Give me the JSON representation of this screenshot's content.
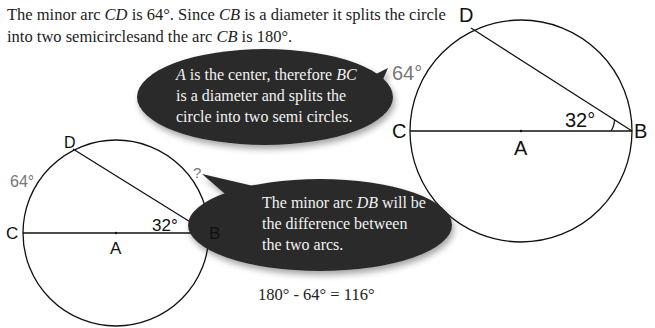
{
  "intro": {
    "line1_parts": [
      "The minor arc ",
      "CD",
      " is 64°.  Since ",
      "CB",
      " is a diameter it splits the circle"
    ],
    "line2_parts": [
      "into two semicirclesand the arc ",
      "CB",
      " is 180°."
    ]
  },
  "bubble_top": {
    "line1_parts": [
      "A",
      " is the center, therefore ",
      "BC"
    ],
    "line2": "is a diameter and splits the",
    "line3": "circle into two semi circles."
  },
  "bubble_bottom": {
    "line1_parts": [
      "The minor arc ",
      "DB",
      " will be"
    ],
    "line2": "the difference between",
    "line3": "the two arcs."
  },
  "formula": "180° - 64° = 116°",
  "diagram_large": {
    "points": {
      "C": "C",
      "A": "A",
      "B": "B",
      "D": "D"
    },
    "arc_label": "64°",
    "angle_label": "32°"
  },
  "diagram_small": {
    "points": {
      "C": "C",
      "A": "A",
      "B": "B",
      "D": "D"
    },
    "arc_label": "64°",
    "angle_label": "32°",
    "unknown_arc_label": "?"
  },
  "colors": {
    "bubble": "#2b2b2b",
    "bubble_text": "#f2f2f2",
    "arc_label": "#777777",
    "line": "#111111"
  }
}
